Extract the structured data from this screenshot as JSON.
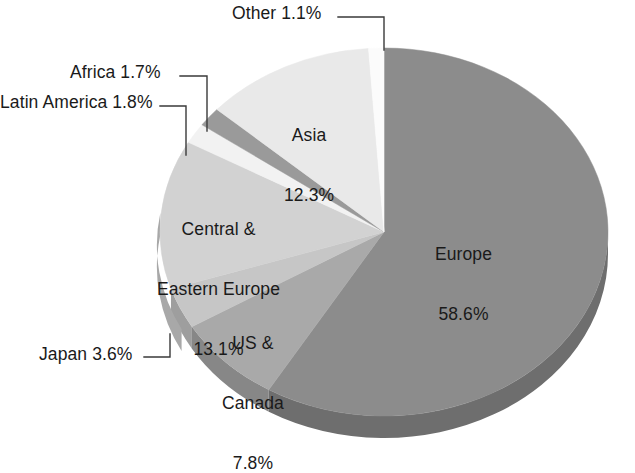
{
  "chart_data": {
    "type": "pie",
    "title": "",
    "subtitle": "",
    "xlabel": "",
    "ylabel": "",
    "legend_position": "none",
    "grid": false,
    "style": "3d-pie",
    "unit": "%",
    "total": 100.0,
    "categories": [
      "Europe",
      "US & Canada",
      "Japan",
      "Central & Eastern Europe",
      "Latin America",
      "Africa",
      "Asia",
      "Other"
    ],
    "values": [
      58.6,
      7.8,
      3.6,
      13.1,
      1.8,
      1.7,
      12.3,
      1.1
    ],
    "slices": [
      {
        "name": "Europe",
        "label": "Europe",
        "value": 58.6,
        "value_text": "58.6%",
        "color": "#8c8c8c",
        "side_color": "#6e6e6e",
        "label_placement": "inside",
        "label_text": "Europe\n58.6%"
      },
      {
        "name": "US & Canada",
        "label": "US &\nCanada",
        "value": 7.8,
        "value_text": "7.8%",
        "color": "#a9a9a9",
        "side_color": "#878787",
        "label_placement": "inside",
        "label_text": "US &\nCanada\n7.8%"
      },
      {
        "name": "Japan",
        "label": "Japan",
        "value": 3.6,
        "value_text": "3.6%",
        "color": "#c6c6c6",
        "side_color": "#9e9e9e",
        "label_placement": "outside-left",
        "label_text": "Japan 3.6%"
      },
      {
        "name": "Central & Eastern Europe",
        "label": "Central &\nEastern Europe",
        "value": 13.1,
        "value_text": "13.1%",
        "color": "#d2d2d2",
        "side_color": "#a8a8a8",
        "label_placement": "inside",
        "label_text": "Central &\nEastern Europe\n13.1%"
      },
      {
        "name": "Latin America",
        "label": "Latin America",
        "value": 1.8,
        "value_text": "1.8%",
        "color": "#f2f2f2",
        "side_color": "#c2c2c2",
        "label_placement": "outside-left",
        "label_text": "Latin America 1.8%"
      },
      {
        "name": "Africa",
        "label": "Africa",
        "value": 1.7,
        "value_text": "1.7%",
        "color": "#9a9a9a",
        "side_color": "#7c7c7c",
        "label_placement": "outside-left",
        "label_text": "Africa 1.7%"
      },
      {
        "name": "Asia",
        "label": "Asia",
        "value": 12.3,
        "value_text": "12.3%",
        "color": "#e9e9e9",
        "side_color": "#bcbcbc",
        "label_placement": "inside",
        "label_text": "Asia\n12.3%"
      },
      {
        "name": "Other",
        "label": "Other",
        "value": 1.1,
        "value_text": "1.1%",
        "color": "#fbfbfb",
        "side_color": "#cdcdcd",
        "label_placement": "outside-top",
        "label_text": "Other 1.1%"
      }
    ]
  },
  "labels": {
    "other": "Other 1.1%",
    "africa": "Africa 1.7%",
    "latin_america": "Latin America 1.8%",
    "japan": "Japan 3.6%",
    "asia_name": "Asia",
    "asia_value": "12.3%",
    "europe_name": "Europe",
    "europe_value": "58.6%",
    "cee_line1": "Central &",
    "cee_line2": "Eastern Europe",
    "cee_value": "13.1%",
    "usc_line1": "US &",
    "usc_line2": "Canada",
    "usc_value": "7.8%"
  },
  "colors": {
    "background": "#ffffff",
    "text": "#1a1a1a",
    "leader_line": "#3a3a3a",
    "europe": "#8c8c8c",
    "us_canada": "#a9a9a9",
    "japan": "#c6c6c6",
    "cee": "#d2d2d2",
    "latin_america": "#f2f2f2",
    "africa": "#9a9a9a",
    "asia": "#e9e9e9",
    "other": "#fbfbfb"
  }
}
